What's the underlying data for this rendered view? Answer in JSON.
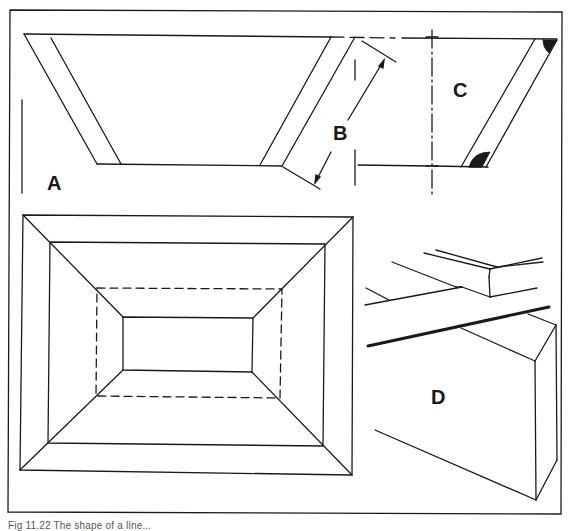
{
  "figure": {
    "panels": [
      {
        "id": "A",
        "label": "A",
        "description": "cross-section of tray with sloping sides"
      },
      {
        "id": "B",
        "label": "B",
        "description": "dimension of sloping side width"
      },
      {
        "id": "C",
        "label": "C",
        "description": "side section with filled corner fillets"
      },
      {
        "id": "D",
        "label": "D",
        "description": "perspective of mitred edge joint"
      }
    ],
    "plan_view": {
      "description": "plan view of tray showing mitred corners and dashed hidden outline"
    }
  },
  "caption": "Fig 11.22  The shape of a line..."
}
